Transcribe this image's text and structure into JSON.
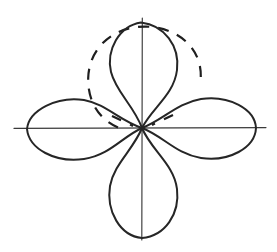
{
  "figure": {
    "title": "Four-lobe rose pattern with dashed reference circle",
    "background_color": "#ffffff",
    "width": 277,
    "height": 252,
    "style": "hand-drawn scanned line art"
  },
  "axes": {
    "name": "cartesian-cross-axes",
    "color": "#3a3a3a",
    "stroke_width": 1.15,
    "origin": {
      "x": 142,
      "y": 128
    },
    "horizontal": {
      "x_start": 14,
      "x_end": 266,
      "y": 128
    },
    "vertical": {
      "y_start": 18,
      "y_end": 240,
      "x": 142
    },
    "tick_marks": "none",
    "tick_labels": "none",
    "axis_labels": "none"
  },
  "lobes": {
    "color": "#262626",
    "stroke_width": 2.0,
    "count": 4,
    "items": [
      {
        "name": "lobe-top",
        "direction": "up",
        "angle_deg": 90,
        "tip": {
          "x": 142,
          "y": 22
        },
        "max_half_width": 42,
        "length": 106
      },
      {
        "name": "lobe-bottom",
        "direction": "down",
        "angle_deg": 270,
        "tip": {
          "x": 142,
          "y": 238
        },
        "max_half_width": 42,
        "length": 110
      },
      {
        "name": "lobe-left",
        "direction": "left",
        "angle_deg": 180,
        "tip": {
          "x": 26,
          "y": 128
        },
        "max_half_width": 40,
        "length": 116
      },
      {
        "name": "lobe-right",
        "direction": "right",
        "angle_deg": 0,
        "tip": {
          "x": 256,
          "y": 128
        },
        "max_half_width": 40,
        "length": 114
      }
    ]
  },
  "reference_circle": {
    "name": "dashed-reference-circle",
    "style": "dashed",
    "color": "#1f1f1f",
    "stroke_width": 2.2,
    "dash_pattern": "10 9",
    "center": {
      "x": 144,
      "y": 84
    },
    "radius": 57,
    "visible_arc_deg": [
      8,
      352
    ],
    "note": "dashed circle overlays the upper lobe region"
  },
  "chart_data": {
    "type": "line",
    "title": "Four-lobe rose pattern with dashed reference circle",
    "subtitle": "",
    "xlabel": "",
    "ylabel": "",
    "xlim": [
      -1.15,
      1.15
    ],
    "ylim": [
      -1.15,
      1.15
    ],
    "grid": false,
    "legend": "none",
    "coordinate_system": "polar overlaid on cartesian cross-axes",
    "series": [
      {
        "name": "rose-curve-four-lobes",
        "equation": "r = |cos(2*theta)|",
        "style": "solid",
        "color": "#262626",
        "lobe_directions_deg": [
          0,
          90,
          180,
          270
        ],
        "lobe_peak_radius": 1.0,
        "values": [
          1.0,
          1.0,
          1.0,
          1.0
        ]
      },
      {
        "name": "reference-circle",
        "equation": "circle of radius 0.5 centered at (0, 0.42)",
        "style": "dashed",
        "color": "#1f1f1f",
        "center": [
          0.02,
          0.42
        ],
        "radius": 0.5
      }
    ],
    "annotations": []
  }
}
